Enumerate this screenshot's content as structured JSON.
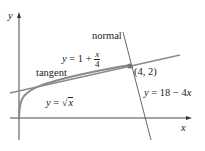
{
  "diagram": {
    "axes": {
      "x_label": "x",
      "y_label": "y"
    },
    "curve": {
      "label_lhs": "y",
      "label_eq": "=",
      "label_rhs_x": "x",
      "label_sqrt": "√",
      "equation": "y = √x",
      "color": "#8a8a8a"
    },
    "tangent": {
      "name": "tangent",
      "label_lhs": "y",
      "label_eq": "= 1 +",
      "frac_num": "x",
      "frac_den": "4",
      "equation": "y = 1 + x/4",
      "color": "#8a8a8a"
    },
    "normal": {
      "name": "normal",
      "equation": "y = 18 − 4x",
      "label_lhs": "y",
      "label_rest": "= 18 − 4",
      "label_x": "x",
      "color": "#555555"
    },
    "point": {
      "label": "(4, 2)",
      "x": 4,
      "y": 2,
      "color": "#777777"
    }
  }
}
